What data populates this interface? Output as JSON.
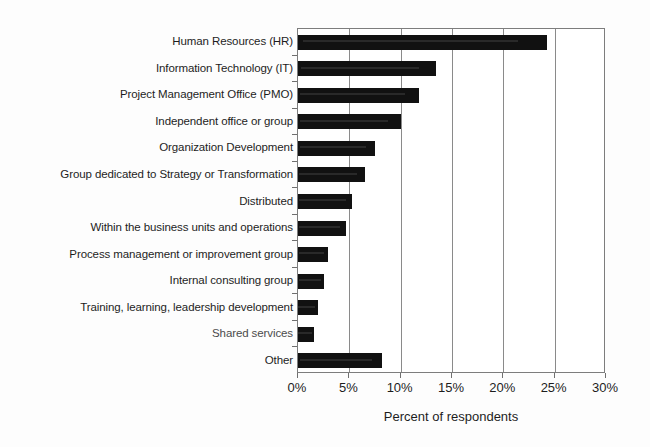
{
  "chart_data": {
    "type": "bar",
    "orientation": "horizontal",
    "title": "",
    "xlabel": "Percent of respondents",
    "ylabel": "",
    "xlim": [
      0,
      30
    ],
    "xunit": "%",
    "grid": true,
    "legend": null,
    "bar_color": "#111111",
    "background_color": "#ffffff",
    "axis_color": "#7d7d7d",
    "xticks": [
      "0%",
      "5%",
      "10%",
      "15%",
      "20%",
      "25%",
      "30%"
    ],
    "xtick_values": [
      0,
      5,
      10,
      15,
      20,
      25,
      30
    ],
    "categories": [
      "Human Resources (HR)",
      "Information Technology (IT)",
      "Project Management Office (PMO)",
      "Independent office or group",
      "Organization Development",
      "Group dedicated to Strategy or Transformation",
      "Distributed",
      "Within the business units and operations",
      "Process management or improvement group",
      "Internal consulting group",
      "Training, learning, leadership development",
      "Shared services",
      "Other"
    ],
    "values": [
      24.3,
      13.4,
      11.8,
      10.0,
      7.5,
      6.5,
      5.3,
      4.7,
      2.9,
      2.5,
      1.9,
      1.6,
      8.2
    ]
  }
}
